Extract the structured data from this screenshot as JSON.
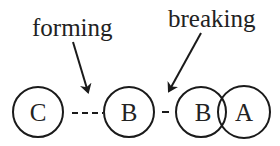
{
  "diagram": {
    "labels": {
      "forming": "forming",
      "breaking": "breaking"
    },
    "nodes": [
      {
        "id": "C",
        "label": "C",
        "cx": 38,
        "cy": 112,
        "r": 25
      },
      {
        "id": "B1",
        "label": "B",
        "cx": 129,
        "cy": 112,
        "r": 25
      },
      {
        "id": "B2",
        "label": "B",
        "cx": 201,
        "cy": 112,
        "r": 25
      },
      {
        "id": "A",
        "label": "A",
        "cx": 244,
        "cy": 112,
        "r": 26
      }
    ],
    "bonds": [
      {
        "from": "C",
        "to": "B1",
        "style": "dashed",
        "state": "forming"
      },
      {
        "from": "B1",
        "to": "B2",
        "style": "short-dash",
        "state": "breaking"
      },
      {
        "from": "B2",
        "to": "A",
        "style": "overlap",
        "state": "bonded"
      }
    ],
    "colors": {
      "stroke": "#1a1a1a",
      "text": "#222222",
      "background": "#ffffff"
    }
  }
}
